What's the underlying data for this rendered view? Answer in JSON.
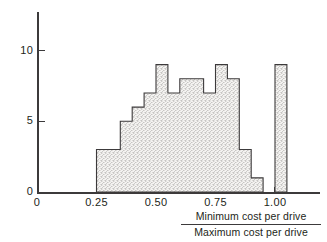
{
  "chart_data": {
    "type": "bar",
    "title": "",
    "subtitle": "",
    "xlabel_numerator": "Minimum cost per drive",
    "xlabel_denominator": "Maximum cost per drive",
    "ylabel": "",
    "xlim": [
      0,
      1.1
    ],
    "ylim": [
      0,
      13
    ],
    "grid": false,
    "legend": null,
    "x_ticks": [
      {
        "value": 0,
        "label": "0"
      },
      {
        "value": 0.25,
        "label": "0.25"
      },
      {
        "value": 0.5,
        "label": "0.50"
      },
      {
        "value": 0.75,
        "label": "0.75"
      },
      {
        "value": 1.0,
        "label": "1.00"
      }
    ],
    "y_ticks": [
      {
        "value": 0,
        "label": "0"
      },
      {
        "value": 5,
        "label": "5"
      },
      {
        "value": 10,
        "label": "10"
      }
    ],
    "bin_width": 0.05,
    "bins": [
      {
        "x0": 0.25,
        "x1": 0.3,
        "value": 3
      },
      {
        "x0": 0.3,
        "x1": 0.35,
        "value": 3
      },
      {
        "x0": 0.35,
        "x1": 0.4,
        "value": 5
      },
      {
        "x0": 0.4,
        "x1": 0.45,
        "value": 6
      },
      {
        "x0": 0.45,
        "x1": 0.5,
        "value": 7
      },
      {
        "x0": 0.5,
        "x1": 0.55,
        "value": 9
      },
      {
        "x0": 0.55,
        "x1": 0.6,
        "value": 7
      },
      {
        "x0": 0.6,
        "x1": 0.65,
        "value": 8
      },
      {
        "x0": 0.65,
        "x1": 0.7,
        "value": 8
      },
      {
        "x0": 0.7,
        "x1": 0.75,
        "value": 7
      },
      {
        "x0": 0.75,
        "x1": 0.8,
        "value": 9
      },
      {
        "x0": 0.8,
        "x1": 0.85,
        "value": 8
      },
      {
        "x0": 0.85,
        "x1": 0.9,
        "value": 3
      },
      {
        "x0": 0.9,
        "x1": 0.95,
        "value": 1
      },
      {
        "x0": 0.95,
        "x1": 1.0,
        "value": 0
      },
      {
        "x0": 1.0,
        "x1": 1.05,
        "value": 9
      }
    ],
    "categories": [
      "0.25",
      "0.30",
      "0.35",
      "0.40",
      "0.45",
      "0.50",
      "0.55",
      "0.60",
      "0.65",
      "0.70",
      "0.75",
      "0.80",
      "0.85",
      "0.90",
      "0.95",
      "1.00"
    ],
    "values": [
      3,
      3,
      5,
      6,
      7,
      9,
      7,
      8,
      8,
      7,
      9,
      8,
      3,
      1,
      0,
      9
    ],
    "colors": {
      "ink": "#3c3a3b",
      "text": "#231f20",
      "bar_fill": "#f2f2f0",
      "bar_stipple": "#9a9795",
      "background": "#ffffff"
    }
  }
}
